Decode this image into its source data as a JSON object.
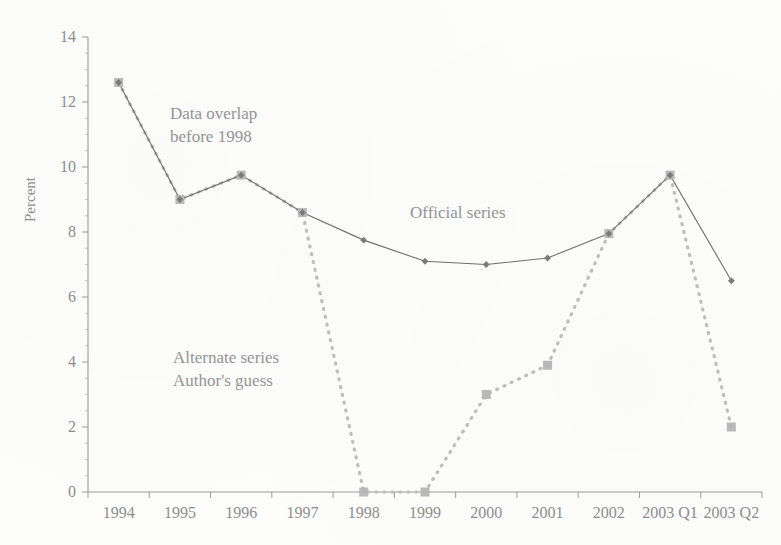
{
  "chart_data": {
    "type": "line",
    "title": "",
    "xlabel": "",
    "ylabel": "Percent",
    "categories": [
      "1994",
      "1995",
      "1996",
      "1997",
      "1998",
      "1999",
      "2000",
      "2001",
      "2002",
      "2003 Q1",
      "2003 Q2"
    ],
    "ylim": [
      0,
      14
    ],
    "yticks": [
      0,
      2,
      4,
      6,
      8,
      10,
      12,
      14
    ],
    "ytick_labels": [
      "0",
      "2",
      "4",
      "6",
      "8",
      "10",
      "12",
      "14"
    ],
    "grid": false,
    "legend": "none",
    "series": [
      {
        "name": "Official series",
        "style": "solid",
        "color": "#6f6f6f",
        "marker": "diamond",
        "values": [
          12.6,
          9.0,
          9.75,
          8.6,
          7.75,
          7.1,
          7.0,
          7.2,
          7.95,
          9.75,
          6.5
        ]
      },
      {
        "name": "Alternate series",
        "style": "dotted",
        "color": "#b8b8b8",
        "marker": "square",
        "values": [
          12.6,
          9.0,
          9.75,
          8.6,
          0.0,
          0.0,
          3.0,
          3.9,
          7.95,
          9.75,
          2.0
        ]
      }
    ],
    "annotations": [
      {
        "id": "overlap",
        "line1": "Data overlap",
        "line2": "before 1998"
      },
      {
        "id": "alternate",
        "line1": "Alternate series",
        "line2": "Author's guess"
      },
      {
        "id": "official",
        "line1": "Official series",
        "line2": ""
      }
    ]
  },
  "colors": {
    "axis": "#9a9a9a",
    "official_line": "#6f6f6f",
    "alternate_line": "#bdbdbd",
    "marker_official": "#7a7a7a",
    "marker_alternate": "#b5b5b5",
    "text": "#8d8d8d",
    "background": "#fdfdfc"
  }
}
